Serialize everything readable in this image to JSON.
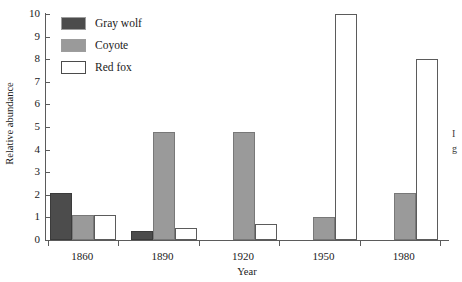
{
  "chart_data": {
    "type": "bar",
    "title": "",
    "xlabel": "Year",
    "ylabel": "Relative abundance",
    "categories": [
      "1860",
      "1890",
      "1920",
      "1950",
      "1980"
    ],
    "ylim": [
      0,
      10
    ],
    "y_ticks": [
      0,
      1,
      2,
      3,
      4,
      5,
      6,
      7,
      8,
      9,
      10
    ],
    "grid": false,
    "legend_position": "top-left",
    "series": [
      {
        "name": "Gray wolf",
        "color": "#4c4c4c",
        "values": [
          2.1,
          0.4,
          0,
          0,
          0
        ]
      },
      {
        "name": "Coyote",
        "color": "#9a9a9a",
        "values": [
          1.1,
          4.8,
          4.8,
          1.0,
          2.1
        ]
      },
      {
        "name": "Red fox",
        "color": "#ffffff",
        "values": [
          1.1,
          0.55,
          0.7,
          10,
          8
        ]
      }
    ]
  },
  "legend": {
    "items": [
      {
        "label": "Gray wolf",
        "swatch": "wolf"
      },
      {
        "label": "Coyote",
        "swatch": "coyote"
      },
      {
        "label": "Red fox",
        "swatch": "fox"
      }
    ]
  },
  "margin_text": {
    "line1": "I",
    "line2": "g"
  }
}
